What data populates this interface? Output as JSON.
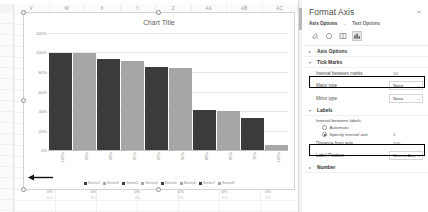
{
  "spreadsheet": {
    "columns": [
      "V",
      "W",
      "X",
      "Y",
      "Z",
      "AA",
      "AB",
      "AC"
    ],
    "bottom_row": [
      {
        "pct": "0%",
        "sub": "0%"
      },
      {
        "pct": "0%",
        "sub": "0%"
      },
      {
        "pct": "0%",
        "sub": "0%"
      },
      {
        "pct": "0%",
        "sub": "0%"
      },
      {
        "pct": "0%",
        "sub": "0%"
      },
      {
        "pct": "0%",
        "sub": "0%"
      }
    ]
  },
  "chart_data": {
    "type": "bar",
    "title": "Chart Title",
    "xlabel": "",
    "ylabel": "",
    "ylim": [
      0,
      120
    ],
    "grid": true,
    "legend_position": "bottom",
    "ytick_labels": [
      "120%",
      "100%",
      "80%",
      "60%",
      "40%",
      "20%",
      "0%"
    ],
    "ytick_values": [
      120,
      100,
      80,
      60,
      40,
      20,
      0
    ],
    "categories": [
      "100%",
      "99%",
      "98%",
      "95%",
      "93%",
      "90%",
      "88%",
      "85%",
      "70%",
      "100%"
    ],
    "bars": [
      {
        "label": "Series1",
        "value": 100,
        "color": "#3b3b3b"
      },
      {
        "label": "Series2",
        "value": 99,
        "color": "#a6a6a6"
      },
      {
        "label": "Series3",
        "value": 93,
        "color": "#3b3b3b"
      },
      {
        "label": "Series4",
        "value": 91,
        "color": "#a6a6a6"
      },
      {
        "label": "Series5",
        "value": 85,
        "color": "#3b3b3b"
      },
      {
        "label": "Series6",
        "value": 84,
        "color": "#a6a6a6"
      },
      {
        "label": "Series7",
        "value": 41,
        "color": "#3b3b3b"
      },
      {
        "label": "Series8",
        "value": 40,
        "color": "#a6a6a6"
      },
      {
        "label": "Series9",
        "value": 33,
        "color": "#3b3b3b"
      },
      {
        "label": "Series10",
        "value": 5,
        "color": "#a6a6a6"
      }
    ],
    "legend": [
      {
        "label": "Series1",
        "color": "#3b3b3b"
      },
      {
        "label": "Series2",
        "color": "#a6a6a6"
      },
      {
        "label": "Series3",
        "color": "#3b3b3b"
      },
      {
        "label": "Series4",
        "color": "#a6a6a6"
      },
      {
        "label": "Series5",
        "color": "#3b3b3b"
      },
      {
        "label": "Series6",
        "color": "#a6a6a6"
      },
      {
        "label": "Series7",
        "color": "#3b3b3b"
      },
      {
        "label": "Series8",
        "color": "#a6a6a6"
      }
    ]
  },
  "pane": {
    "title": "Format Axis",
    "collapse_icon": "chevron-down",
    "tabs": [
      {
        "label": "Axis Options",
        "active": true
      },
      {
        "label": "Text Options",
        "active": false
      }
    ],
    "icons": [
      {
        "name": "fill-line-icon",
        "glyph": "◔",
        "active": false
      },
      {
        "name": "effects-icon",
        "glyph": "⬠",
        "active": false
      },
      {
        "name": "size-properties-icon",
        "glyph": "▥",
        "active": false
      },
      {
        "name": "axis-options-icon",
        "glyph": "▮▮",
        "active": true
      }
    ],
    "sections": {
      "axis_options": {
        "label": "Axis Options",
        "expanded": false,
        "caret": "▸"
      },
      "tick_marks": {
        "label": "Tick Marks",
        "expanded": true,
        "caret": "▾",
        "interval_label": "Interval between marks",
        "interval_value": "10",
        "major_type_label": "Major type",
        "major_type_value": "None",
        "minor_type_label": "Minor type",
        "minor_type_value": "None"
      },
      "labels": {
        "label": "Labels",
        "expanded": true,
        "caret": "▾",
        "interval_between_labels_label": "Interval between labels",
        "automatic_label": "Automatic",
        "automatic_selected": false,
        "specify_label": "Specify interval unit",
        "specify_selected": true,
        "specify_value": "1",
        "distance_label": "Distance from axis",
        "distance_value": "100",
        "position_label": "Label Position",
        "position_value": "Next to Axis"
      },
      "number": {
        "label": "Number",
        "expanded": false,
        "caret": "▸"
      }
    }
  }
}
